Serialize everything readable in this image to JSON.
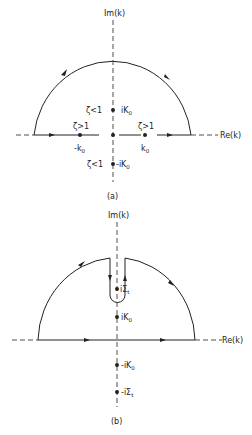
{
  "figure_a": {
    "im_axis_label": "Im(k)",
    "re_axis_label": "Re(k)",
    "caption": "(a)",
    "points": {
      "upper_imag": "iK",
      "upper_imag_sub": "0",
      "upper_imag_cond": "ζ<1",
      "lower_imag": "-iK",
      "lower_imag_sub": "0",
      "lower_imag_cond": "ζ<1",
      "neg_real": "-k",
      "neg_real_sub": "0",
      "neg_real_cond": "ζ>1",
      "pos_real": "k",
      "pos_real_sub": "0",
      "pos_real_cond": "ζ>1"
    }
  },
  "figure_b": {
    "im_axis_label": "Im(k)",
    "re_axis_label": "Re(k)",
    "caption": "(b)",
    "points": {
      "upper_sigma": "iΣ",
      "upper_sigma_sub": "t",
      "upper_k": "iK",
      "upper_k_sub": "0",
      "lower_k": "-iK",
      "lower_k_sub": "0",
      "lower_sigma": "-iΣ",
      "lower_sigma_sub": "t"
    }
  },
  "colors": {
    "ink": "#222222",
    "background": "#ffffff"
  }
}
